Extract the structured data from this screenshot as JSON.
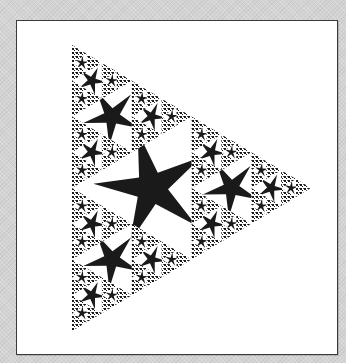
{
  "figure": {
    "kind": "sierpinski-star-fractal",
    "orientation": "pointing-right",
    "background_color": "#d3d3d3",
    "panel_color": "#ffffff",
    "border_color": "#3a3a3a",
    "ink_color": "#1a1a1a",
    "triangle": {
      "top": [
        72,
        45
      ],
      "bottom": [
        72,
        331
      ],
      "right": [
        311,
        188
      ]
    },
    "recursion_depth": 4,
    "star_arms": 5
  }
}
